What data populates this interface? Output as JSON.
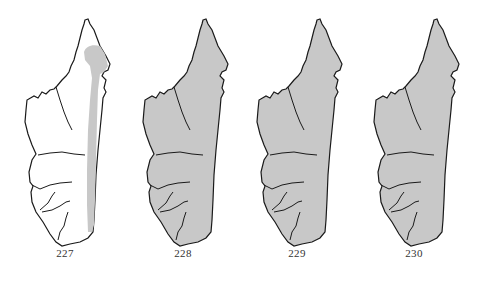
{
  "figure": {
    "outline_color": "#1a1a1a",
    "range_fill_color": "#c8c8c8",
    "background_color": "#ffffff",
    "maps": [
      {
        "number": "227",
        "range": "eastern-strip",
        "offset_x": 0
      },
      {
        "number": "228",
        "range": "whole-island",
        "offset_x": 118
      },
      {
        "number": "229",
        "range": "whole-island",
        "offset_x": 232
      },
      {
        "number": "230",
        "range": "whole-island",
        "offset_x": 349
      }
    ]
  }
}
